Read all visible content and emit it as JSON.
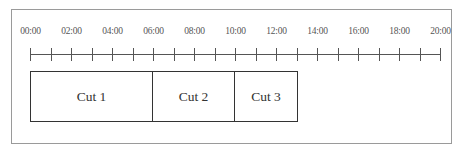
{
  "timeline": {
    "axis": {
      "start_hour": 0,
      "end_hour": 20,
      "tick_interval_hours": 1,
      "label_interval_hours": 2,
      "labels": [
        "00:00",
        "02:00",
        "04:00",
        "06:00",
        "08:00",
        "10:00",
        "12:00",
        "14:00",
        "16:00",
        "18:00",
        "20:00"
      ]
    },
    "cuts": [
      {
        "label": "Cut 1",
        "start": "00:00",
        "end": "06:00"
      },
      {
        "label": "Cut 2",
        "start": "06:00",
        "end": "10:00"
      },
      {
        "label": "Cut 3",
        "start": "10:00",
        "end": "13:00"
      }
    ],
    "colors": {
      "frame": "#9a9a9a",
      "axis": "#555555",
      "cut_border": "#333333",
      "text": "#333333"
    }
  }
}
